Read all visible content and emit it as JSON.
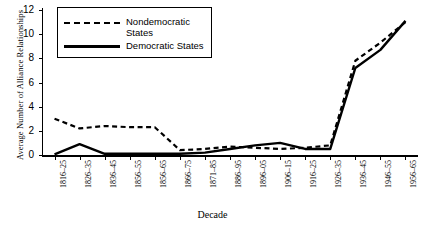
{
  "chart_data": {
    "type": "line",
    "title": "",
    "xlabel": "Decade",
    "ylabel": "Average Number of Alliance Relationships",
    "ylim": [
      0,
      12
    ],
    "yticks": [
      0,
      2,
      4,
      6,
      8,
      10,
      12
    ],
    "grid": false,
    "legend_position": "top-left",
    "categories": [
      "1816–25",
      "1826–35",
      "1836–45",
      "1856–55",
      "1856–65",
      "1866–75",
      "1871–85",
      "1886–95",
      "1896–05",
      "1906–15",
      "1916–25",
      "1926–35",
      "1936–45",
      "1946–55",
      "1956–65"
    ],
    "series": [
      {
        "name": "Nondemocratic States",
        "style": "dashed",
        "color": "#000000",
        "values": [
          3.0,
          2.2,
          2.4,
          2.3,
          2.3,
          0.4,
          0.5,
          0.7,
          0.6,
          0.5,
          0.6,
          0.8,
          7.8,
          9.3,
          11.0
        ]
      },
      {
        "name": "Democratic States",
        "style": "solid",
        "color": "#000000",
        "values": [
          0.05,
          0.9,
          0.1,
          0.1,
          0.1,
          0.1,
          0.2,
          0.5,
          0.8,
          1.0,
          0.5,
          0.5,
          7.2,
          8.7,
          11.1
        ]
      }
    ]
  },
  "legend": {
    "nondemocratic_label": "Nondemocratic\nStates",
    "democratic_label": "Democratic States"
  },
  "axis": {
    "y_title": "Average Number of Alliance Relationships",
    "x_title": "Decade"
  }
}
